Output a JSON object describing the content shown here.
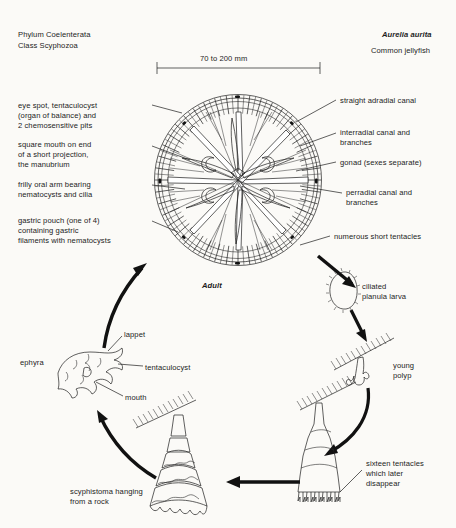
{
  "header": {
    "phylum": "Phylum Coelenterata",
    "class": "Class Scyphozoa",
    "species": "Aurelia aurita",
    "common_name": "Common jellyfish"
  },
  "scale_bar": {
    "label": "70 to 200 mm"
  },
  "labels_left": [
    {
      "id": "eye-spot",
      "lines": [
        "eye spot, tentaculocyst",
        "(organ of balance) and",
        "2 chemosensitive pits"
      ]
    },
    {
      "id": "square-mouth",
      "lines": [
        "square mouth on end",
        "of a short projection,",
        "the manubrium"
      ]
    },
    {
      "id": "oral-arm",
      "lines": [
        "frilly oral arm bearing",
        "nematocysts and cilia"
      ]
    },
    {
      "id": "gastric-pouch",
      "lines": [
        "gastric pouch (one of 4)",
        "containing gastric",
        "filaments with nematocysts"
      ]
    }
  ],
  "labels_right": [
    {
      "id": "adradial-canal",
      "lines": [
        "straight adradial canal"
      ]
    },
    {
      "id": "interradial-canal",
      "lines": [
        "interradial canal and",
        "branches"
      ]
    },
    {
      "id": "gonad",
      "lines": [
        "gonad (sexes separate)"
      ]
    },
    {
      "id": "perradial-canal",
      "lines": [
        "perradial canal and",
        "branches"
      ]
    },
    {
      "id": "tentacles",
      "lines": [
        "numerous short tentacles"
      ]
    }
  ],
  "stages": {
    "adult": "Adult",
    "planula": [
      "ciliated",
      "planula larva"
    ],
    "young_polyp": [
      "young",
      "polyp"
    ],
    "sixteen_tentacles": [
      "sixteen tentacles",
      "which later",
      "disappear"
    ],
    "scyphistoma": [
      "scyphistoma hanging",
      "from a rock"
    ],
    "ephyra": "ephyra"
  },
  "ephyra_labels": {
    "lappet": "lappet",
    "tentaculocyst": "tentaculocyst",
    "mouth": "mouth"
  },
  "colors": {
    "ink": "#1c1c1c",
    "paper": "#fbfaf7"
  }
}
